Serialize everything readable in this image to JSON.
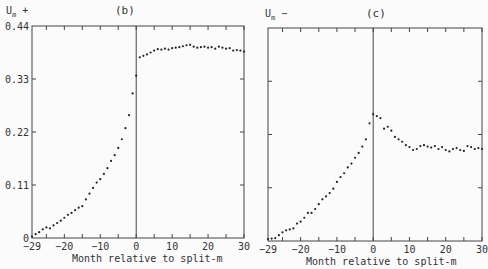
{
  "chart_data": [
    {
      "type": "scatter",
      "panel": "(b)",
      "title": "(b)",
      "ylabel": "Um +",
      "xlabel": "Month relative to split-m",
      "xlim": [
        -29,
        30
      ],
      "ylim": [
        0,
        0.44
      ],
      "x_ticks": [
        "-29",
        "-20",
        "-10",
        "0",
        "10",
        "20",
        "30"
      ],
      "y_ticks": [
        "0",
        "0.11",
        "0.22",
        "0.33",
        "0.44"
      ],
      "vline_at": 0,
      "grid": false,
      "x": [
        -29,
        -28,
        -27,
        -26,
        -25,
        -24,
        -23,
        -22,
        -21,
        -20,
        -19,
        -18,
        -17,
        -16,
        -15,
        -14,
        -13,
        -12,
        -11,
        -10,
        -9,
        -8,
        -7,
        -6,
        -5,
        -4,
        -3,
        -2,
        -1,
        0,
        1,
        2,
        3,
        4,
        5,
        6,
        7,
        8,
        9,
        10,
        11,
        12,
        13,
        14,
        15,
        16,
        17,
        18,
        19,
        20,
        21,
        22,
        23,
        24,
        25,
        26,
        27,
        28,
        29,
        30
      ],
      "values": [
        0.003,
        0.008,
        0.012,
        0.018,
        0.022,
        0.02,
        0.026,
        0.031,
        0.036,
        0.042,
        0.048,
        0.052,
        0.058,
        0.063,
        0.066,
        0.08,
        0.092,
        0.104,
        0.115,
        0.122,
        0.133,
        0.145,
        0.16,
        0.172,
        0.187,
        0.205,
        0.228,
        0.255,
        0.3,
        0.337,
        0.375,
        0.378,
        0.381,
        0.385,
        0.389,
        0.392,
        0.391,
        0.393,
        0.391,
        0.394,
        0.395,
        0.396,
        0.398,
        0.4,
        0.401,
        0.397,
        0.395,
        0.396,
        0.397,
        0.395,
        0.396,
        0.393,
        0.397,
        0.395,
        0.393,
        0.394,
        0.389,
        0.39,
        0.389,
        0.387
      ]
    },
    {
      "type": "scatter",
      "panel": "(c)",
      "title": "(c)",
      "ylabel": "Um -",
      "xlabel": "Month relative to split-m",
      "xlim": [
        -29,
        30
      ],
      "ylim": [
        0,
        0.44
      ],
      "x_ticks": [
        "-29",
        "-20",
        "-10",
        "0",
        "10",
        "20",
        "30"
      ],
      "y_ticks": [],
      "vline_at": 0,
      "grid": false,
      "x": [
        -29,
        -28,
        -27,
        -26,
        -25,
        -24,
        -23,
        -22,
        -21,
        -20,
        -19,
        -18,
        -17,
        -16,
        -15,
        -14,
        -13,
        -12,
        -11,
        -10,
        -9,
        -8,
        -7,
        -6,
        -5,
        -4,
        -3,
        -2,
        -1,
        0,
        1,
        2,
        3,
        4,
        5,
        6,
        7,
        8,
        9,
        10,
        11,
        12,
        13,
        14,
        15,
        16,
        17,
        18,
        19,
        20,
        21,
        22,
        23,
        24,
        25,
        26,
        27,
        28,
        29,
        30
      ],
      "values": [
        0.004,
        0.005,
        0.006,
        0.012,
        0.018,
        0.022,
        0.024,
        0.026,
        0.036,
        0.04,
        0.048,
        0.058,
        0.058,
        0.066,
        0.076,
        0.086,
        0.092,
        0.099,
        0.108,
        0.122,
        0.132,
        0.14,
        0.152,
        0.16,
        0.172,
        0.182,
        0.195,
        0.21,
        0.243,
        0.262,
        0.258,
        0.254,
        0.232,
        0.236,
        0.228,
        0.215,
        0.21,
        0.205,
        0.198,
        0.194,
        0.188,
        0.19,
        0.196,
        0.198,
        0.195,
        0.193,
        0.196,
        0.19,
        0.194,
        0.188,
        0.185,
        0.19,
        0.192,
        0.188,
        0.186,
        0.196,
        0.194,
        0.19,
        0.192,
        0.19
      ]
    }
  ]
}
